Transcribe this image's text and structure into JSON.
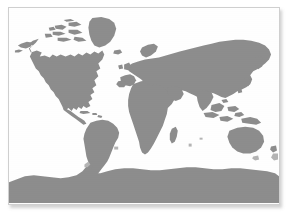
{
  "figure": {
    "kind": "world-map",
    "projection": "equirectangular",
    "alt": "Grayscale world map showing all continents including Antarctica"
  },
  "colors": {
    "page_background": "#ffffff",
    "panel_background": "#fefefe",
    "panel_border": "#cfcfcf",
    "land": "#8d8d8d",
    "land_soft": "#b4b4b4",
    "ocean": "#fefefe",
    "shadow": "rgba(120,120,120,0.35)"
  },
  "panel": {
    "x": 8,
    "y": 7,
    "width": 272,
    "height": 198
  },
  "landmasses": [
    {
      "name": "north-america",
      "label": "North America"
    },
    {
      "name": "greenland",
      "label": "Greenland"
    },
    {
      "name": "canadian-arctic",
      "label": "Canadian Arctic Archipelago"
    },
    {
      "name": "central-america",
      "label": "Central America"
    },
    {
      "name": "caribbean",
      "label": "Caribbean Islands"
    },
    {
      "name": "south-america",
      "label": "South America"
    },
    {
      "name": "africa",
      "label": "Africa"
    },
    {
      "name": "madagascar",
      "label": "Madagascar"
    },
    {
      "name": "europe",
      "label": "Europe"
    },
    {
      "name": "asia",
      "label": "Asia"
    },
    {
      "name": "british-isles",
      "label": "British Isles"
    },
    {
      "name": "iceland",
      "label": "Iceland"
    },
    {
      "name": "japan",
      "label": "Japan"
    },
    {
      "name": "southeast-asia",
      "label": "Southeast Asia"
    },
    {
      "name": "new-guinea",
      "label": "New Guinea"
    },
    {
      "name": "australia",
      "label": "Australia"
    },
    {
      "name": "new-zealand",
      "label": "New Zealand"
    },
    {
      "name": "antarctica",
      "label": "Antarctica"
    }
  ],
  "labels": {
    "none_visible": ""
  }
}
